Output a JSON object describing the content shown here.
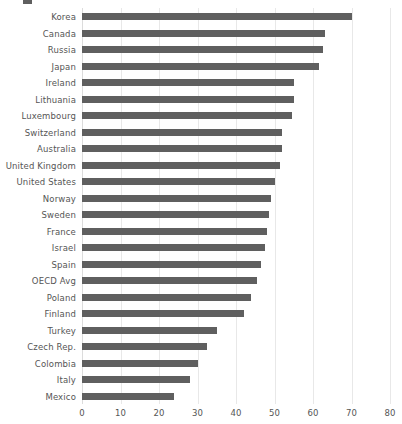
{
  "chart_data": {
    "type": "bar",
    "orientation": "horizontal",
    "title": "",
    "xlabel": "",
    "ylabel": "",
    "xlim": [
      0,
      80
    ],
    "xticks": [
      0,
      10,
      20,
      30,
      40,
      50,
      60,
      70,
      80
    ],
    "grid": true,
    "legend": false,
    "bar_color": "#5f5f5f",
    "label_color": "#555555",
    "gridline_color": "#e8e8e8",
    "categories": [
      "Korea",
      "Canada",
      "Russia",
      "Japan",
      "Ireland",
      "Lithuania",
      "Luxembourg",
      "Switzerland",
      "Australia",
      "United Kingdom",
      "United States",
      "Norway",
      "Sweden",
      "France",
      "Israel",
      "Spain",
      "OECD Avg",
      "Poland",
      "Finland",
      "Turkey",
      "Czech Rep.",
      "Colombia",
      "Italy",
      "Mexico"
    ],
    "values": [
      70.0,
      63.0,
      62.5,
      61.5,
      55.0,
      55.0,
      54.5,
      52.0,
      52.0,
      51.5,
      50.0,
      49.0,
      48.5,
      48.0,
      47.5,
      46.5,
      45.5,
      44.0,
      42.0,
      35.0,
      32.5,
      30.0,
      28.0,
      24.0
    ]
  }
}
